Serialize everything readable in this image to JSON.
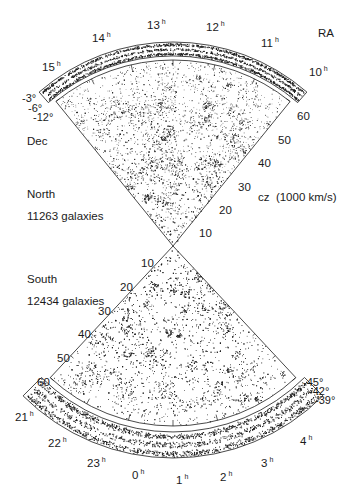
{
  "figure": {
    "title_axis_ra": "RA",
    "dec_label": "Dec",
    "cz_label": "cz  (1000 km/s)",
    "north": {
      "name": "North",
      "count_label": "11263 galaxies",
      "galaxy_count": 11263,
      "ra_ticks": [
        {
          "label": "15",
          "unit": "h"
        },
        {
          "label": "14",
          "unit": "h"
        },
        {
          "label": "13",
          "unit": "h"
        },
        {
          "label": "12",
          "unit": "h"
        },
        {
          "label": "11",
          "unit": "h"
        },
        {
          "label": "10",
          "unit": "h"
        }
      ],
      "dec_strips": [
        "-3°",
        "-6°",
        "-12°"
      ],
      "cz_ticks": [
        "10",
        "20",
        "30",
        "40",
        "50",
        "60"
      ]
    },
    "south": {
      "name": "South",
      "count_label": "12434 galaxies",
      "galaxy_count": 12434,
      "ra_ticks": [
        {
          "label": "21",
          "unit": "h"
        },
        {
          "label": "22",
          "unit": "h"
        },
        {
          "label": "23",
          "unit": "h"
        },
        {
          "label": "0",
          "unit": "h"
        },
        {
          "label": "1",
          "unit": "h"
        },
        {
          "label": "2",
          "unit": "h"
        },
        {
          "label": "3",
          "unit": "h"
        },
        {
          "label": "4",
          "unit": "h"
        }
      ],
      "dec_strips": [
        "-45°",
        "-42°",
        "-39°"
      ],
      "cz_ticks": [
        "10",
        "20",
        "30",
        "40",
        "50",
        "60"
      ]
    },
    "colors": {
      "ink": "#1a1a1a",
      "background": "#ffffff"
    }
  }
}
